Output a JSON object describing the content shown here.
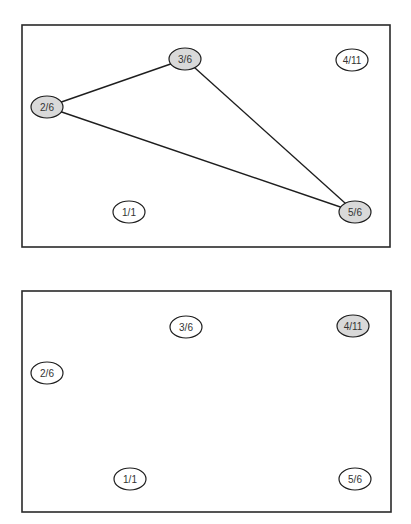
{
  "colors": {
    "highlight_fill": "#d9d9d9",
    "normal_fill": "#ffffff",
    "stroke": "#1e1e1e"
  },
  "panels": [
    {
      "id": "top",
      "frame": {
        "x": 22,
        "y": 25,
        "w": 368,
        "h": 222
      },
      "nodes": [
        {
          "id": "n1",
          "label": "1/1",
          "cx": 129,
          "cy": 212,
          "highlighted": false
        },
        {
          "id": "n2",
          "label": "2/6",
          "cx": 47,
          "cy": 107,
          "highlighted": true
        },
        {
          "id": "n3",
          "label": "3/6",
          "cx": 185,
          "cy": 59,
          "highlighted": true
        },
        {
          "id": "n4",
          "label": "4/11",
          "cx": 352,
          "cy": 60,
          "highlighted": false
        },
        {
          "id": "n5",
          "label": "5/6",
          "cx": 355,
          "cy": 212,
          "highlighted": true
        }
      ],
      "edges": [
        {
          "from": "n2",
          "to": "n3"
        },
        {
          "from": "n3",
          "to": "n5"
        },
        {
          "from": "n2",
          "to": "n5"
        }
      ]
    },
    {
      "id": "bottom",
      "frame": {
        "x": 22,
        "y": 291,
        "w": 369,
        "h": 221
      },
      "nodes": [
        {
          "id": "n1",
          "label": "1/1",
          "cx": 130,
          "cy": 479,
          "highlighted": false
        },
        {
          "id": "n2",
          "label": "2/6",
          "cx": 47,
          "cy": 373,
          "highlighted": false
        },
        {
          "id": "n3",
          "label": "3/6",
          "cx": 186,
          "cy": 327,
          "highlighted": false
        },
        {
          "id": "n4",
          "label": "4/11",
          "cx": 353,
          "cy": 326,
          "highlighted": true
        },
        {
          "id": "n5",
          "label": "5/6",
          "cx": 355,
          "cy": 479,
          "highlighted": false
        }
      ],
      "edges": []
    }
  ]
}
